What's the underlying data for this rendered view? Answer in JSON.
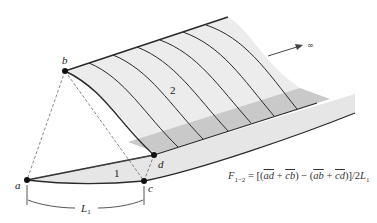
{
  "diagram": {
    "type": "view-factor-geometry",
    "points": [
      {
        "id": "a",
        "label": "a"
      },
      {
        "id": "b",
        "label": "b"
      },
      {
        "id": "c",
        "label": "c"
      },
      {
        "id": "d",
        "label": "d"
      }
    ],
    "surfaces": [
      {
        "id": "1",
        "label": "1"
      },
      {
        "id": "2",
        "label": "2"
      }
    ],
    "dimension": {
      "label": "L",
      "subscript": "1"
    },
    "infinity_arrow": {
      "label": "∞"
    },
    "formula": {
      "lhs": "F",
      "lhs_sub": "1−2",
      "equals": " = [(",
      "ad": "ad",
      "plus1": " + ",
      "cb": "cb",
      "mid": ") − (",
      "ab": "ab",
      "plus2": " + ",
      "cd": "cd",
      "close": ")]/2",
      "L": "L",
      "L_sub": "1",
      "full_text": "F1−2 = [(ad + cb) − (ab + cd)]/2L1"
    },
    "colors": {
      "surface_fill": "#ececec",
      "shadow_fill": "#c9c9c9",
      "line": "#2a2a2a",
      "dashed": "#555555"
    }
  }
}
